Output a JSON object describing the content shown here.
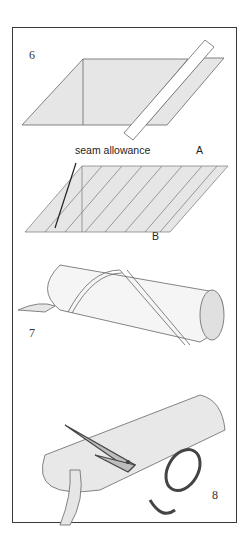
{
  "figure": {
    "steps": [
      {
        "number": "6",
        "description": "parallelogram fabric with cut strip"
      },
      {
        "number": "7",
        "description": "fabric rolled into tube with seam strips"
      },
      {
        "number": "8",
        "description": "cutting spiral bias strip with scissors"
      }
    ],
    "labels": {
      "seam_allowance": "seam allowance",
      "point_a": "A",
      "point_b": "B"
    },
    "colors": {
      "fabric": "#e6e6e6",
      "line": "#555555",
      "frame": "#3a3a3a"
    }
  }
}
